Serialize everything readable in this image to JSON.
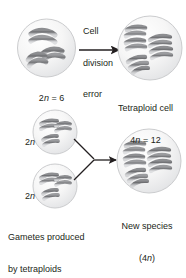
{
  "diagram": {
    "title_caption": "",
    "process_label": {
      "line1": "Cell",
      "line2": "division",
      "line3": "error"
    },
    "cells": [
      {
        "id": "diploid-parent-cell",
        "label_main": "2",
        "label_italic": "n",
        "label_tail": " = 6",
        "ploidy": "2n = 6",
        "chromosome_pairs": 3,
        "chromosome_count": 6
      },
      {
        "id": "tetraploid-cell",
        "label_main": "Tetraploid cell",
        "label_italic": "n",
        "label_prefix": "4",
        "label_tail": " = 12",
        "ploidy": "4n = 12",
        "chromosome_pairs": 6,
        "chromosome_count": 12
      },
      {
        "id": "gamete-cell-upper",
        "label_italic": "n",
        "label_prefix": "2",
        "ploidy": "2n"
      },
      {
        "id": "gamete-cell-lower",
        "label_italic": "n",
        "label_prefix": "2",
        "ploidy": "2n"
      },
      {
        "id": "new-species-cell",
        "label_main": "New species",
        "label_italic": "n",
        "label_paren_open": "(4",
        "label_paren_close": ")",
        "ploidy": "(4n)",
        "chromosome_count": 12
      }
    ],
    "gamete_caption": {
      "line1": "Gametes produced",
      "line2": "by tetraploids"
    },
    "new_species_caption": {
      "line1": "New species",
      "line2": "(4n)"
    },
    "tetraploid_caption": {
      "line1": "Tetraploid cell",
      "line2": "4n = 12"
    },
    "parent_caption": {
      "line1": "2n = 6"
    },
    "colors": {
      "chromosome_dark": "#6e6f72",
      "chromosome_light": "#c9cacc",
      "cell_fill": "#f2f2f2",
      "cell_stroke": "#c8c9cb",
      "arrow": "#231f20",
      "text": "#231f20",
      "background": "#ffffff"
    }
  }
}
